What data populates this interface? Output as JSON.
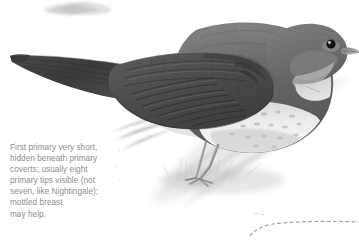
{
  "plate": {
    "title": "Thrush Nightingale wing and primary identification plate",
    "medium": "graphite pencil drawing",
    "background_color": "#ffffff",
    "caption": {
      "text": "First primary very short,\nhidden beneath primary\ncoverts; usually eight\nprimary tips visible (not\nseven, like Nightingale);\nmottled breast\nmay help.",
      "color": "#8d8d8d",
      "lines": [
        "First primary very short,",
        "hidden beneath primary",
        "coverts; usually eight",
        "primary tips visible (not",
        "seven, like Nightingale);",
        "mottled breast",
        "may help."
      ]
    },
    "subject": {
      "name": "perched-songbird",
      "orientation": "facing right",
      "colors": {
        "upperparts": "#6f6f6f",
        "wing_dark": "#4a4a4a",
        "tail_dark": "#3f3f3f",
        "underparts": "#e8e8e8",
        "breast_mottling": "#b9b9b9",
        "eye": "#1a1a1a",
        "bill": "#8a8a8a",
        "leg": "#9a9a9a"
      }
    },
    "marks": {
      "ghost_sketch_top_label": "faint pencil sketch mark",
      "ghost_sketch_mid_label": "faint ghost feather sketch",
      "dashed_curve_label": "dashed guide curve",
      "dashed_curve_color": "#9e9e9e"
    }
  }
}
